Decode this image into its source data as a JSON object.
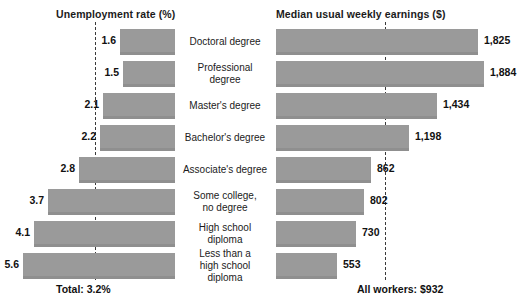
{
  "chart_data": {
    "type": "bar",
    "title": "",
    "layout": "diverging-dual-panel",
    "categories": [
      "Doctoral degree",
      "Professional degree",
      "Master's degree",
      "Bachelor's degree",
      "Associate's degree",
      "Some college,\nno degree",
      "High school diploma",
      "Less than a\nhigh school diploma"
    ],
    "panels": [
      {
        "id": "unemployment",
        "title": "Unemployment rate (%)",
        "side": "left",
        "ylabel": "",
        "xlabel": "Unemployment rate (%)",
        "values": [
          1.6,
          1.5,
          2.1,
          2.2,
          2.8,
          3.7,
          4.1,
          5.6
        ],
        "value_labels": [
          "1.6",
          "1.5",
          "2.1",
          "2.2",
          "2.8",
          "3.7",
          "4.1",
          "5.6"
        ],
        "reference_value": 3.2,
        "reference_label": "Total: 3.2%",
        "xlim": [
          0,
          5.6
        ]
      },
      {
        "id": "earnings",
        "title": "Median usual weekly earnings ($)",
        "side": "right",
        "ylabel": "",
        "xlabel": "Median usual weekly earnings ($)",
        "values": [
          1825,
          1884,
          1434,
          1198,
          862,
          802,
          730,
          553
        ],
        "value_labels": [
          "1,825",
          "1,884",
          "1,434",
          "1,198",
          "862",
          "802",
          "730",
          "553"
        ],
        "reference_value": 932,
        "reference_label": "All workers: $932",
        "xlim": [
          0,
          1884
        ]
      }
    ],
    "grid": false,
    "legend": "none",
    "colors": {
      "bar": "#9a9a9a",
      "bar_shadow": "#8f8f8f",
      "reference_line": "#3a3a3a",
      "text": "#1b1b1b",
      "background": "#ffffff"
    }
  },
  "rows": [
    {
      "category_lines": [
        "Doctoral degree"
      ],
      "left_value": "1.6",
      "right_value": "1,825",
      "left_bar_left": 120,
      "left_bar_width": 55,
      "right_bar_width": 202,
      "left_label_right_edge": 116,
      "right_label_left": 484
    },
    {
      "category_lines": [
        "Professional degree"
      ],
      "left_value": "1.5",
      "right_value": "1,884",
      "left_bar_left": 123,
      "left_bar_width": 52,
      "right_bar_width": 208,
      "left_label_right_edge": 119,
      "right_label_left": 490
    },
    {
      "category_lines": [
        "Master's degree"
      ],
      "left_value": "2.1",
      "right_value": "1,434",
      "left_bar_left": 103,
      "left_bar_width": 72,
      "right_bar_width": 161,
      "left_label_right_edge": 99,
      "right_label_left": 443
    },
    {
      "category_lines": [
        "Bachelor's degree"
      ],
      "left_value": "2.2",
      "right_value": "1,198",
      "left_bar_left": 100,
      "left_bar_width": 75,
      "right_bar_width": 133,
      "left_label_right_edge": 96,
      "right_label_left": 415
    },
    {
      "category_lines": [
        "Associate's degree"
      ],
      "left_value": "2.8",
      "right_value": "862",
      "left_bar_left": 79,
      "left_bar_width": 96,
      "right_bar_width": 95,
      "left_label_right_edge": 75,
      "right_label_left": 377
    },
    {
      "category_lines": [
        "Some college,",
        "no degree"
      ],
      "left_value": "3.7",
      "right_value": "802",
      "left_bar_left": 48,
      "left_bar_width": 127,
      "right_bar_width": 88,
      "left_label_right_edge": 44,
      "right_label_left": 370
    },
    {
      "category_lines": [
        "High school diploma"
      ],
      "left_value": "4.1",
      "right_value": "730",
      "left_bar_left": 34,
      "left_bar_width": 141,
      "right_bar_width": 80,
      "left_label_right_edge": 30,
      "right_label_left": 362
    },
    {
      "category_lines": [
        "Less than a",
        "high school diploma"
      ],
      "left_value": "5.6",
      "right_value": "553",
      "left_bar_left": 23,
      "left_bar_width": 152,
      "right_bar_width": 61,
      "left_label_right_edge": 19,
      "right_label_left": 343
    }
  ],
  "titles": {
    "left": "Unemployment rate (%)",
    "right": "Median usual weekly earnings ($)"
  },
  "footers": {
    "left": "Total: 3.2%",
    "right": "All workers: $932"
  }
}
